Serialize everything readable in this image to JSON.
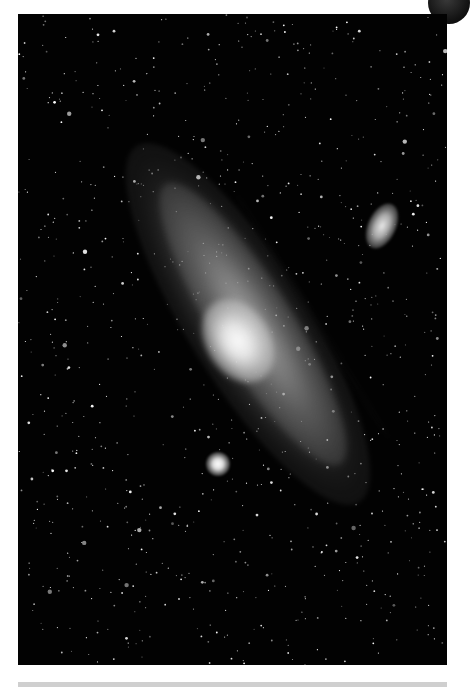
{
  "image": {
    "subject": "Spiral galaxy with two satellite galaxies against a star field",
    "colors": {
      "background": "#ffffff",
      "sky": "#020202",
      "galaxy_core": "#fafafa",
      "bottom_bar": "#cfcfcf"
    }
  }
}
